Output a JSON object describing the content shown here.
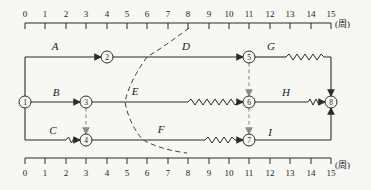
{
  "ruler": {
    "unit": "(周)",
    "ticks": [
      "0",
      "1",
      "2",
      "3",
      "4",
      "5",
      "6",
      "7",
      "8",
      "9",
      "10",
      "11",
      "12",
      "13",
      "14",
      "15"
    ]
  },
  "nodes": {
    "n1": "1",
    "n2": "2",
    "n3": "3",
    "n4": "4",
    "n5": "5",
    "n6": "6",
    "n7": "7",
    "n8": "8"
  },
  "activities": {
    "A": {
      "label": "A",
      "from": "1",
      "to": "2",
      "start_week": 0,
      "solid_to_week": 4
    },
    "B": {
      "label": "B",
      "from": "1",
      "to": "3",
      "start_week": 0,
      "solid_to_week": 3
    },
    "C": {
      "label": "C",
      "from": "1",
      "to": "4",
      "start_week": 0,
      "solid_to_week": 2,
      "wave_to_week": 3
    },
    "D": {
      "label": "D",
      "from": "2",
      "to": "5",
      "start_week": 4,
      "solid_to_week": 11
    },
    "E": {
      "label": "E",
      "from": "3",
      "to": "6",
      "start_week": 3,
      "solid_to_week": 8,
      "wave_to_week": 11
    },
    "F": {
      "label": "F",
      "from": "4",
      "to": "7",
      "start_week": 3,
      "solid_to_week": 9,
      "wave_to_week": 11
    },
    "G": {
      "label": "G",
      "from": "5",
      "to": "8",
      "start_week": 11,
      "solid_to_week": 13,
      "wave_to_week": 15
    },
    "H": {
      "label": "H",
      "from": "6",
      "to": "8",
      "start_week": 11,
      "solid_to_week": 14,
      "wave_to_week": 15
    },
    "I": {
      "label": "I",
      "from": "7",
      "to": "8",
      "start_week": 11,
      "solid_to_week": 15
    }
  },
  "dummy_links": [
    {
      "from": "3",
      "to": "4"
    },
    {
      "from": "5",
      "to": "6"
    },
    {
      "from": "6",
      "to": "7"
    }
  ],
  "front_line": {
    "check_week": 8,
    "crossings": [
      {
        "activity": "D",
        "week": 6
      },
      {
        "activity": "E",
        "week": 5
      },
      {
        "activity": "F",
        "week": 6
      }
    ]
  }
}
